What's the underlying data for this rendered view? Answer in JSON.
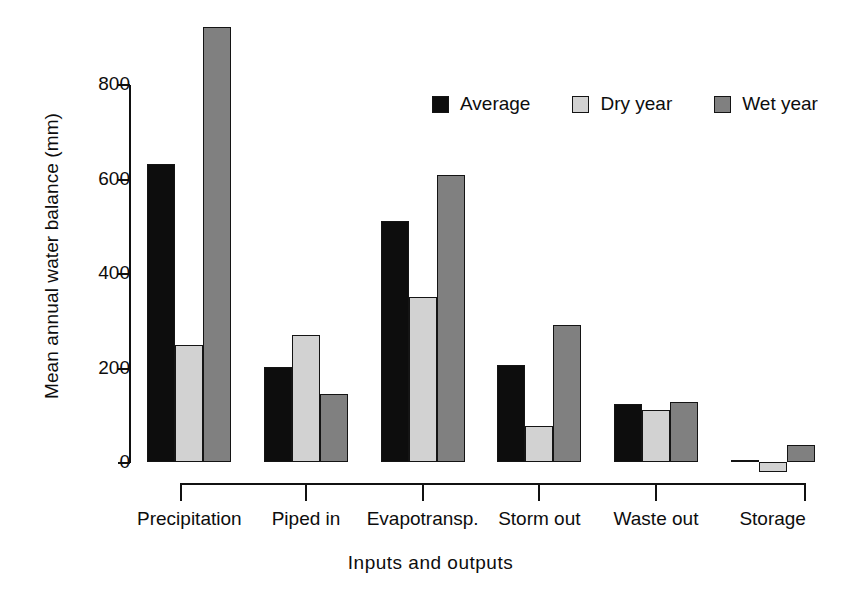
{
  "chart_data": {
    "type": "bar",
    "title": "",
    "xlabel": "Inputs  and  outputs",
    "ylabel": "Mean annual water balance (mm)",
    "categories": [
      "Precipitation",
      "Piped in",
      "Evapotransp.",
      "Storm out",
      "Waste out",
      "Storage"
    ],
    "series": [
      {
        "name": "Average",
        "color": "#0d0d0d",
        "values": [
          631,
          202,
          510,
          206,
          122,
          3
        ]
      },
      {
        "name": "Dry year",
        "color": "#d2d2d2",
        "values": [
          247,
          268,
          349,
          76,
          110,
          -21
        ]
      },
      {
        "name": "Wet year",
        "color": "#808080",
        "values": [
          921,
          143,
          608,
          291,
          128,
          37
        ]
      }
    ],
    "ylim": [
      -30,
      940
    ],
    "yticks": [
      0,
      200,
      400,
      600,
      800
    ],
    "ytick_labels": [
      "0",
      "200",
      "400",
      "600",
      "800"
    ],
    "grid": false,
    "legend_position": "top-right",
    "units": "mm"
  },
  "axes": {
    "y_label": "Mean annual water balance (mm)",
    "x_label": "Inputs  and  outputs",
    "y_ticks": [
      "800",
      "600",
      "400",
      "200",
      "0"
    ]
  },
  "legend": {
    "items": [
      {
        "label": "Average",
        "color": "#0d0d0d"
      },
      {
        "label": "Dry year",
        "color": "#d2d2d2"
      },
      {
        "label": "Wet year",
        "color": "#808080"
      }
    ]
  },
  "x_categories": [
    "Precipitation",
    "Piped in",
    "Evapotransp.",
    "Storm out",
    "Waste out",
    "Storage"
  ]
}
